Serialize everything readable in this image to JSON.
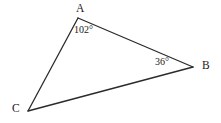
{
  "figure": {
    "type": "triangle-diagram",
    "background_color": "#ffffff",
    "stroke_color": "#2b2b2b",
    "stroke_width": 1.3,
    "width": 221,
    "height": 123,
    "vertices": [
      {
        "name": "A",
        "label": "A",
        "x": 78,
        "y": 18
      },
      {
        "name": "B",
        "label": "B",
        "x": 193,
        "y": 67
      },
      {
        "name": "C",
        "label": "C",
        "x": 28,
        "y": 111
      }
    ],
    "edges": [
      {
        "name": "edge-ab",
        "from": "A",
        "to": "B"
      },
      {
        "name": "edge-bc",
        "from": "B",
        "to": "C"
      },
      {
        "name": "edge-ca",
        "from": "C",
        "to": "A"
      }
    ],
    "angle_labels": [
      {
        "name": "angle-a",
        "vertex": "A",
        "text": "102°",
        "value": 102
      },
      {
        "name": "angle-b",
        "vertex": "B",
        "text": "36°",
        "value": 36
      }
    ],
    "vertex_labels": {
      "a": "A",
      "b": "B",
      "c": "C"
    },
    "angles": {
      "a_text": "102°",
      "b_text": "36°"
    }
  }
}
